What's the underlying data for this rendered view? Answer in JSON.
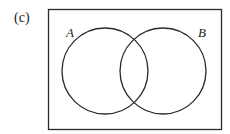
{
  "figure": {
    "panel_label": "(c)",
    "sets": [
      {
        "name": "A",
        "label": "A",
        "cx": 105,
        "cy": 71,
        "r": 43
      },
      {
        "name": "B",
        "label": "B",
        "cx": 163,
        "cy": 71,
        "r": 43
      }
    ],
    "universe": {
      "x": 48,
      "y": 9,
      "width": 173,
      "height": 120
    },
    "colors": {
      "stroke": "#2a2a2a",
      "background": "#ffffff"
    }
  }
}
